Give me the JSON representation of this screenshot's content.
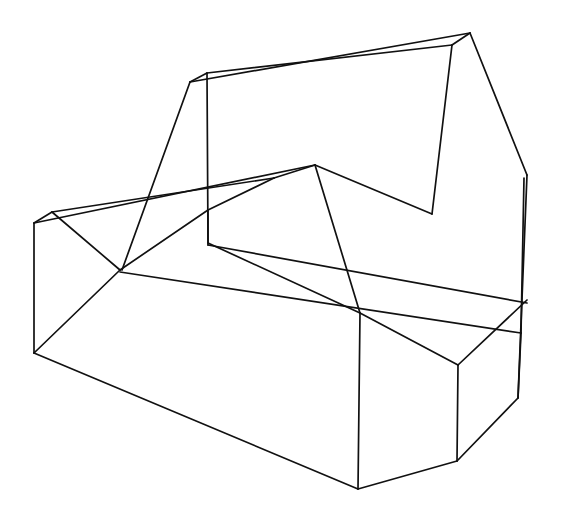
{
  "figure": {
    "canvas": {
      "width": 575,
      "height": 520,
      "background": "#ffffff"
    },
    "style": {
      "stroke_color": "#111111",
      "stroke_width": 1.7,
      "fill": "none",
      "line_cap": "round",
      "line_join": "round"
    },
    "projection": "isometric-like oblique axonometric",
    "visible_text": []
  },
  "geometry": {
    "vertices": {
      "A_backpanel_topleft": [
        190,
        82
      ],
      "B_backpanel_topleft_inner": [
        207,
        73
      ],
      "C_backpanel_topright": [
        470,
        33
      ],
      "D_backpanel_topright_inner": [
        452,
        45
      ],
      "E_backpanel_lowerleft": [
        122,
        270
      ],
      "F_vertical_junction": [
        208,
        210
      ],
      "G_backpanel_rightbottom": [
        432,
        214
      ],
      "H_sliver_top": [
        527,
        175
      ],
      "I_sliver_mid": [
        521,
        333
      ],
      "J_sliver_bottom": [
        518,
        395
      ],
      "K_ridge_peak": [
        315,
        165
      ],
      "L_ridge_left": [
        274,
        178
      ],
      "M_left_top_apex": [
        52,
        212
      ],
      "N_left_top_front": [
        34,
        223
      ],
      "O_left_bottom": [
        34,
        353
      ],
      "P_notch_bottom": [
        120,
        270
      ],
      "Q_step_topleft": [
        360,
        313
      ],
      "R_step_topright": [
        458,
        365
      ],
      "S_step_botleft": [
        358,
        489
      ],
      "T_step_botright": [
        457,
        461
      ],
      "U_base_front": [
        358,
        489
      ],
      "V_right_lower": [
        497,
        420
      ],
      "W_mid_cross": [
        300,
        245
      ]
    },
    "edge_count": 31,
    "edges": [
      {
        "name": "backpanel-top-outer",
        "points": "190,82 470,33"
      },
      {
        "name": "backpanel-top-inner",
        "points": "207,73 452,45"
      },
      {
        "name": "backpanel-topleft-cap",
        "points": "190,82 207,73"
      },
      {
        "name": "backpanel-topright-cap",
        "points": "470,33 452,45"
      },
      {
        "name": "backpanel-left-slant",
        "points": "190,82 122,270"
      },
      {
        "name": "backpanel-left-vertical",
        "points": "207,73 208,243"
      },
      {
        "name": "backpanel-right-inner-vertical",
        "points": "452,45 432,214"
      },
      {
        "name": "backpanel-right-outer-slant",
        "points": "470,33 527,175"
      },
      {
        "name": "sliver-outer-long",
        "points": "527,175 518,398"
      },
      {
        "name": "sliver-inner-long",
        "points": "524,178 521,333"
      },
      {
        "name": "sliver-lower-converge",
        "points": "521,333 518,398"
      },
      {
        "name": "ridge-peak-left",
        "points": "315,165 274,178"
      },
      {
        "name": "ridge-left-to-junction",
        "points": "274,178 208,210"
      },
      {
        "name": "ridge-peak-to-rightbottom",
        "points": "315,165 432,214"
      },
      {
        "name": "inner-surface-long-left",
        "points": "52,212 274,178"
      },
      {
        "name": "inner-surface-long-left-lower",
        "points": "34,223 315,165"
      },
      {
        "name": "left-apex-cap",
        "points": "52,212 34,223"
      },
      {
        "name": "left-vertical-edge",
        "points": "34,223 34,353"
      },
      {
        "name": "left-notch-down",
        "points": "52,212 120,270"
      },
      {
        "name": "notch-up-right",
        "points": "120,270 208,210"
      },
      {
        "name": "notch-to-bottomleft",
        "points": "120,270 34,353"
      },
      {
        "name": "junction-down-long",
        "points": "208,243 360,313"
      },
      {
        "name": "junction-vertical-short",
        "points": "208,210 208,245"
      },
      {
        "name": "long-mid-rail",
        "points": "120,272 521,333"
      },
      {
        "name": "peak-down-to-step",
        "points": "315,165 360,313"
      },
      {
        "name": "step-top-to-right",
        "points": "360,313 458,365"
      },
      {
        "name": "step-right-up",
        "points": "458,365 527,300"
      },
      {
        "name": "step-left-vertical",
        "points": "360,313 358,489"
      },
      {
        "name": "step-right-vertical",
        "points": "458,365 457,461"
      },
      {
        "name": "base-bottom-left",
        "points": "34,353 358,489"
      },
      {
        "name": "base-bottom-right",
        "points": "358,489 457,461"
      },
      {
        "name": "base-right-rise",
        "points": "457,461 518,398"
      },
      {
        "name": "mid-diagonal-to-right",
        "points": "208,245 527,303"
      }
    ]
  }
}
